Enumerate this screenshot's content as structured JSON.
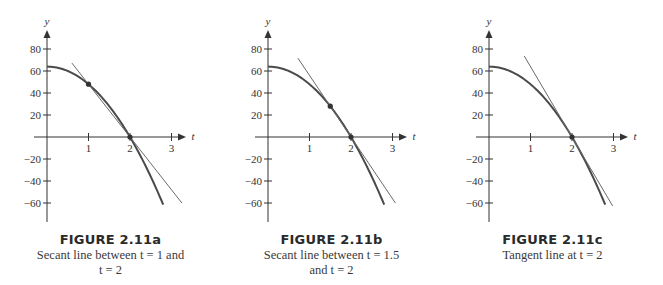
{
  "chart_data": [
    {
      "type": "line",
      "id": "a",
      "title": "FIGURE 2.11a",
      "subtitle": "Secant line between t = 1 and t = 2",
      "caption_lines": [
        "Secant line between t = 1 and",
        "t = 2"
      ],
      "xlabel": "t",
      "ylabel": "y",
      "xticks": [
        1,
        2,
        3
      ],
      "yticks": [
        80,
        60,
        40,
        20,
        -20,
        -40,
        -60
      ],
      "xlim": [
        0,
        3.3
      ],
      "ylim": [
        -70,
        90
      ],
      "grid": false,
      "series": [
        {
          "name": "curve y = 64 - 16t^2",
          "kind": "curve",
          "x": [
            0,
            0.5,
            1,
            1.5,
            2,
            2.5,
            2.8
          ],
          "values": [
            64,
            60,
            48,
            28,
            0,
            -36,
            -61.4
          ]
        },
        {
          "name": "secant line",
          "kind": "line",
          "x": [
            0.6,
            3.25
          ],
          "values": [
            67.2,
            -60
          ],
          "slope": -48
        }
      ],
      "points": [
        {
          "t": 1,
          "y": 48
        },
        {
          "t": 2,
          "y": 0
        }
      ]
    },
    {
      "type": "line",
      "id": "b",
      "title": "FIGURE 2.11b",
      "subtitle": "Secant line between t = 1.5 and t = 2",
      "caption_lines": [
        "Secant line between t = 1.5",
        "and t = 2"
      ],
      "xlabel": "t",
      "ylabel": "y",
      "xticks": [
        1,
        2,
        3
      ],
      "yticks": [
        80,
        60,
        40,
        20,
        -20,
        -40,
        -60
      ],
      "xlim": [
        0,
        3.3
      ],
      "ylim": [
        -70,
        90
      ],
      "grid": false,
      "series": [
        {
          "name": "curve y = 64 - 16t^2",
          "kind": "curve",
          "x": [
            0,
            0.5,
            1,
            1.5,
            2,
            2.5,
            2.8
          ],
          "values": [
            64,
            60,
            48,
            28,
            0,
            -36,
            -61.4
          ]
        },
        {
          "name": "secant line",
          "kind": "line",
          "x": [
            0.72,
            3.07
          ],
          "values": [
            71.7,
            -60
          ],
          "slope": -56
        }
      ],
      "points": [
        {
          "t": 1.5,
          "y": 28
        },
        {
          "t": 2,
          "y": 0
        }
      ]
    },
    {
      "type": "line",
      "id": "c",
      "title": "FIGURE 2.11c",
      "subtitle": "Tangent line at t = 2",
      "caption_lines": [
        "Tangent line at t = 2"
      ],
      "xlabel": "t",
      "ylabel": "y",
      "xticks": [
        1,
        2,
        3
      ],
      "yticks": [
        80,
        60,
        40,
        20,
        -20,
        -40,
        -60
      ],
      "xlim": [
        0,
        3.3
      ],
      "ylim": [
        -70,
        90
      ],
      "grid": false,
      "series": [
        {
          "name": "curve y = 64 - 16t^2",
          "kind": "curve",
          "x": [
            0,
            0.5,
            1,
            1.5,
            2,
            2.5,
            2.8
          ],
          "values": [
            64,
            60,
            48,
            28,
            0,
            -36,
            -61.4
          ]
        },
        {
          "name": "tangent line",
          "kind": "line",
          "x": [
            0.85,
            2.98
          ],
          "values": [
            73.6,
            -62.7
          ],
          "slope": -64
        }
      ],
      "points": [
        {
          "t": 2,
          "y": 0
        }
      ]
    }
  ],
  "colors": {
    "curve": "#4a4a4a",
    "line": "#6a6a6a",
    "axis": "#333333",
    "point": "#333333"
  }
}
